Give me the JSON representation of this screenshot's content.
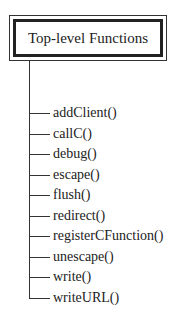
{
  "diagram": {
    "root": {
      "label": "Top-level Functions"
    },
    "children": [
      {
        "label": "addClient()"
      },
      {
        "label": "callC()"
      },
      {
        "label": "debug()"
      },
      {
        "label": "escape()"
      },
      {
        "label": "flush()"
      },
      {
        "label": "redirect()"
      },
      {
        "label": "registerCFunction()"
      },
      {
        "label": "unescape()"
      },
      {
        "label": "write()"
      },
      {
        "label": "writeURL()"
      }
    ]
  }
}
